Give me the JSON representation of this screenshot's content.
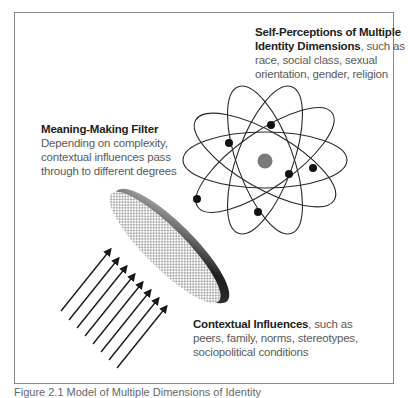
{
  "diagram": {
    "identity_label": {
      "title": "Self-Perceptions of Multiple Identity Dimensions",
      "body": ", such as race, social class, sexual orientation, gender, religion"
    },
    "filter_label": {
      "title": "Meaning-Making Filter",
      "body": "Depending on complexity, contextual influences pass through to different degrees"
    },
    "context_label": {
      "title": "Contextual Influences",
      "body": ", such as peers, family, norms, stereotypes, sociopolitical conditions"
    },
    "caption": "Figure 2.1 Model of Multiple Dimensions of Identity",
    "elements": {
      "atom": {
        "orbits": 4,
        "electrons": 6,
        "nucleus_color": "#7a7a7a"
      },
      "filter_disc": {
        "fill": "crosshatch",
        "rim_gradient": [
          "#bfbfbf",
          "#222222"
        ]
      },
      "arrows": {
        "count": 8,
        "direction": "up-right"
      }
    }
  }
}
